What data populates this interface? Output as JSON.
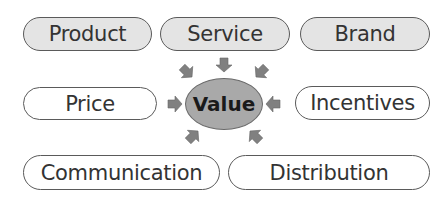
{
  "diagram": {
    "center": {
      "label": "Value",
      "fill": "#a9a9a9"
    },
    "top_row": [
      {
        "label": "Product",
        "style": "filled"
      },
      {
        "label": "Service",
        "style": "filled"
      },
      {
        "label": "Brand",
        "style": "filled"
      }
    ],
    "middle_row": [
      {
        "label": "Price",
        "style": "plain"
      },
      {
        "label": "Incentives",
        "style": "plain"
      }
    ],
    "bottom_row": [
      {
        "label": "Communication",
        "style": "plain"
      },
      {
        "label": "Distribution",
        "style": "plain"
      }
    ],
    "colors": {
      "arrow": "#808080",
      "filled_box": "#e4e4e4",
      "border": "#5a5a5a"
    }
  }
}
